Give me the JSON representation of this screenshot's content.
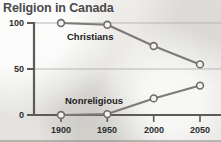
{
  "chart_data": {
    "type": "line",
    "title": "Religion in Canada",
    "xlabel": "",
    "ylabel": "",
    "x": [
      1900,
      1950,
      2000,
      2050
    ],
    "xtick_labels": [
      "1900",
      "1950",
      "2000",
      "2050"
    ],
    "ytick_labels": [
      "0",
      "50",
      "100"
    ],
    "yticks": [
      0,
      50,
      100
    ],
    "ylim": [
      0,
      100
    ],
    "xlim": [
      1900,
      2050
    ],
    "grid": "horizontal",
    "legend": "inline-labels",
    "series": [
      {
        "name": "Christians",
        "values": [
          100,
          98,
          75,
          55
        ],
        "color": "#7d7b78",
        "marker": "circle-open"
      },
      {
        "name": "Nonreligious",
        "values": [
          0,
          1,
          18,
          32
        ],
        "color": "#7d7b78",
        "marker": "circle-open"
      }
    ],
    "annotations": [
      {
        "text": "Christians",
        "x": 1925,
        "y": 88
      },
      {
        "text": "Nonreligious",
        "x": 1922,
        "y": 17
      }
    ]
  },
  "colors": {
    "background": "#e9e8e6",
    "title": "#4a4a4a",
    "axis": "#5d5b58",
    "gridline": "#b9b7b2",
    "line": "#7d7b78",
    "marker_fill": "#f4f3f1",
    "tick_text": "#2e2e2e",
    "label_text": "#1d1d1d"
  },
  "icons": {
    "marker": "circle-open-icon"
  }
}
